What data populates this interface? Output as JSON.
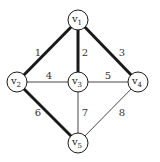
{
  "diagram": {
    "type": "graph",
    "colors": {
      "edge": "#1a1a1a",
      "node_stroke": "#1a1a1a",
      "label": "#333333"
    },
    "nodes": [
      {
        "id": "v1",
        "base": "v",
        "sub": "1",
        "x": 78,
        "y": 20
      },
      {
        "id": "v2",
        "base": "v",
        "sub": "2",
        "x": 17,
        "y": 82
      },
      {
        "id": "v3",
        "base": "v",
        "sub": "3",
        "x": 78,
        "y": 82
      },
      {
        "id": "v4",
        "base": "v",
        "sub": "4",
        "x": 138,
        "y": 82
      },
      {
        "id": "v5",
        "base": "v",
        "sub": "5",
        "x": 78,
        "y": 143
      }
    ],
    "edges": [
      {
        "label": "1",
        "from": "v1",
        "to": "v2",
        "highlighted": true,
        "lx": 38,
        "ly": 56
      },
      {
        "label": "2",
        "from": "v1",
        "to": "v3",
        "highlighted": true,
        "lx": 85,
        "ly": 56
      },
      {
        "label": "3",
        "from": "v1",
        "to": "v4",
        "highlighted": true,
        "lx": 122,
        "ly": 56
      },
      {
        "label": "4",
        "from": "v2",
        "to": "v3",
        "highlighted": false,
        "lx": 49,
        "ly": 79
      },
      {
        "label": "5",
        "from": "v3",
        "to": "v4",
        "highlighted": false,
        "lx": 108,
        "ly": 79
      },
      {
        "label": "6",
        "from": "v2",
        "to": "v5",
        "highlighted": true,
        "lx": 38,
        "ly": 116
      },
      {
        "label": "7",
        "from": "v3",
        "to": "v5",
        "highlighted": false,
        "lx": 85,
        "ly": 116
      },
      {
        "label": "8",
        "from": "v4",
        "to": "v5",
        "highlighted": false,
        "lx": 122,
        "ly": 116
      }
    ]
  }
}
